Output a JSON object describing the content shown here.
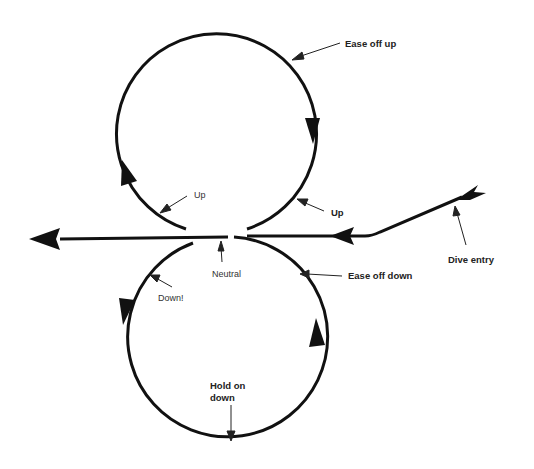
{
  "diagram": {
    "type": "flight-maneuver-figure-eight",
    "colors": {
      "line": "#111111",
      "text": "#222222",
      "background": "#ffffff"
    },
    "labels": {
      "ease_off_up": "Ease off up",
      "up_left": "Up",
      "up_right": "Up",
      "neutral": "Neutral",
      "ease_off_down": "Ease off down",
      "down": "Down!",
      "dive_entry": "Dive entry",
      "hold_on_down_line1": "Hold on",
      "hold_on_down_line2": "down"
    }
  }
}
